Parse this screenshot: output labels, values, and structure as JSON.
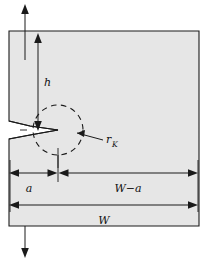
{
  "figure": {
    "kind": "engineering-diagram",
    "background_color": "#ffffff",
    "specimen_fill_color": "#e6e6e6",
    "line_color": "#1a1a1a",
    "dashed_color": "#1a1a1a"
  },
  "specimen": {
    "name": "specimen-body",
    "left_x": 9,
    "right_x": 199,
    "top_y": 31,
    "bottom_y": 226
  },
  "labels": {
    "height": {
      "text": "h",
      "x": 44,
      "y": 82
    },
    "notch_radius": {
      "base": "r",
      "sub": "K",
      "x": 107,
      "y": 142
    },
    "crack_length": {
      "text": "a",
      "x": 29,
      "y": 188
    },
    "ligament": {
      "base": "W",
      "minus": "−",
      "sub_after": "a",
      "text": "W−a",
      "x": 128,
      "y": 188
    },
    "width": {
      "text": "W",
      "x": 104,
      "y": 219
    }
  },
  "dimensions": [
    {
      "id": "h",
      "orientation": "vertical",
      "label": "h",
      "from_y": 38,
      "to_y": 130,
      "x": 38
    },
    {
      "id": "a",
      "orientation": "horizontal",
      "label": "a",
      "from_x": 10,
      "to_x": 57,
      "y": 173
    },
    {
      "id": "W-a",
      "orientation": "horizontal",
      "label": "W−a",
      "from_x": 58,
      "to_x": 198,
      "y": 173
    },
    {
      "id": "W",
      "orientation": "horizontal",
      "label": "W",
      "from_x": 10,
      "to_x": 198,
      "y": 205
    }
  ],
  "load_arrows": [
    {
      "id": "load-top",
      "direction": "up",
      "x": 25,
      "from_y": 60,
      "to_y": 4
    },
    {
      "id": "load-bottom",
      "direction": "down",
      "x": 25,
      "from_y": 226,
      "to_y": 258
    }
  ],
  "notch": {
    "name": "notch-and-crack",
    "mouth_top_y": 121,
    "mouth_bottom_y": 139,
    "tip_x": 58,
    "tip_y": 130
  },
  "crack_circle": {
    "name": "crack-tip-process-zone",
    "center_x": 58,
    "center_y": 130,
    "radius": 25,
    "style": "dashed"
  }
}
